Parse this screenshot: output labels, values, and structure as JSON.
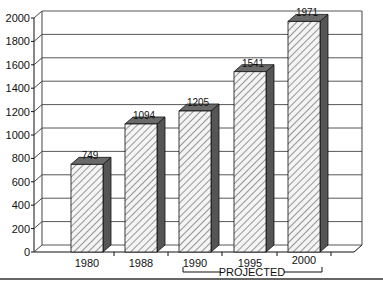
{
  "chart_data": {
    "type": "bar",
    "title": "",
    "xlabel": "",
    "ylabel": "",
    "categories": [
      "1980",
      "1988",
      "1990",
      "1995",
      "2000"
    ],
    "values": [
      749,
      1094,
      1205,
      1541,
      1971
    ],
    "value_labels": [
      "749",
      "1094",
      "1205",
      "1541",
      "1971"
    ],
    "ylim": [
      0,
      2000
    ],
    "yticks": [
      "0",
      "200",
      "400",
      "600",
      "800",
      "1000",
      "1200",
      "1400",
      "1600",
      "1800",
      "2000"
    ],
    "grid": true,
    "style": "3d-hatched",
    "annotation": {
      "label": "PROJECTED",
      "spans": [
        "1990",
        "1995",
        "2000"
      ]
    },
    "colors": {
      "bar_front": "#f2f2f2",
      "bar_hatch": "#555555",
      "bar_side": "#555555",
      "bar_top": "#6a6a6a",
      "grid": "#444444"
    }
  }
}
